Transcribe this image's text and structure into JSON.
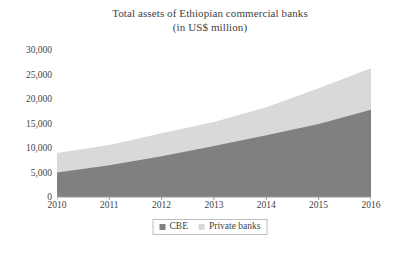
{
  "chart_data": {
    "type": "area",
    "stacked": true,
    "title": "Total assets of Ethiopian commercial banks",
    "subtitle": "(in US$ million)",
    "xlabel": "",
    "ylabel": "",
    "x": [
      2010,
      2011,
      2012,
      2013,
      2014,
      2015,
      2016
    ],
    "categories": [
      "2010",
      "2011",
      "2012",
      "2013",
      "2014",
      "2015",
      "2016"
    ],
    "xticklabels": [
      "2010",
      "2011",
      "2012",
      "2013",
      "2014",
      "2015",
      "2016"
    ],
    "yticklabels": [
      "0",
      "5,000",
      "10,000",
      "15,000",
      "20,000",
      "25,000",
      "30,000"
    ],
    "yticks": [
      0,
      5000,
      10000,
      15000,
      20000,
      25000,
      30000
    ],
    "ylim": [
      0,
      30000
    ],
    "xlim": [
      2010,
      2016
    ],
    "grid": false,
    "legend_position": "below-axis-center",
    "series": [
      {
        "name": "CBE",
        "color": "#808080",
        "values": [
          5000,
          6500,
          8300,
          10400,
          12600,
          14900,
          17800
        ]
      },
      {
        "name": "Private banks",
        "color": "#d9d9d9",
        "values": [
          4000,
          4100,
          4700,
          4900,
          5700,
          7300,
          8500
        ]
      }
    ],
    "cumulative_totals": [
      9000,
      10600,
      13000,
      15300,
      18300,
      22200,
      26300
    ]
  },
  "legend": {
    "items": [
      {
        "label": "CBE",
        "color": "#808080"
      },
      {
        "label": "Private banks",
        "color": "#d9d9d9"
      }
    ]
  },
  "colors": {
    "cbe": "#808080",
    "private_banks": "#d9d9d9",
    "axis": "#9a9a9a",
    "text": "#3f3f3f",
    "background": "#ffffff"
  }
}
